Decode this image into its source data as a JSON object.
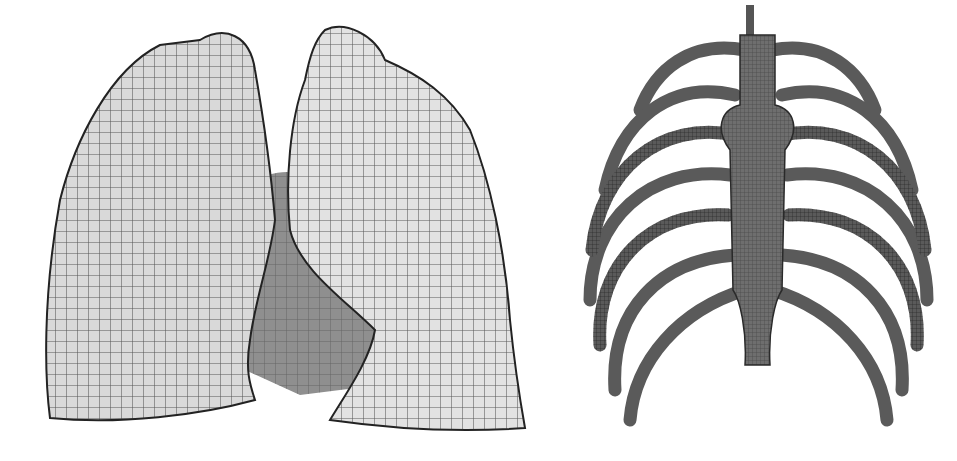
{
  "figures": [
    {
      "id": "lungs",
      "subject": "finite element mesh of lungs (front view)",
      "fill": "#d9d9d9",
      "shadow": "#8f8f8f",
      "line": "#2a2a2a"
    },
    {
      "id": "ribs",
      "subject": "finite element mesh of rib cage with sternum (front view)",
      "fill": "#6e6e6e",
      "shadow": "#3a3a3a",
      "line": "#1e1e1e"
    }
  ],
  "background": "#ffffff"
}
